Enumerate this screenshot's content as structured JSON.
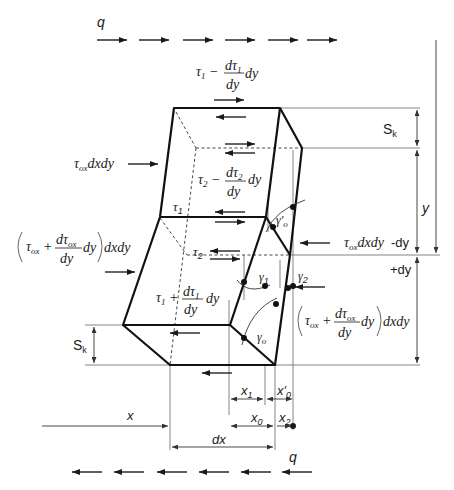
{
  "diagram": {
    "type": "shear-deformation-element",
    "labels": {
      "q_top": "q",
      "q_bottom": "q",
      "tau1_minus": {
        "base": "τ",
        "sub": "1",
        "op": "−",
        "num": "dτ",
        "num_sub": "1",
        "den": "dy",
        "tail": "dy"
      },
      "tau2_minus": {
        "base": "τ",
        "sub": "2",
        "op": "−",
        "num": "dτ",
        "num_sub": "2",
        "den": "dy",
        "tail": "dy"
      },
      "tau1_plus": {
        "base": "τ",
        "sub": "1",
        "op": "+",
        "num": "dτ",
        "num_sub": "1",
        "den": "dy",
        "tail": "dy"
      },
      "tau1": "τ1",
      "tau2": "τ2",
      "tau_ox_left": {
        "base": "τ",
        "sub": "ox",
        "tail": "dxdy"
      },
      "tau_ox_plus_left": {
        "base": "τ",
        "sub": "ox",
        "op": "+",
        "num": "dτ",
        "num_sub": "ox",
        "den": "dy",
        "tail": "dy",
        "after": "dxdy"
      },
      "tau_ox_right": {
        "base": "τ",
        "sub": "ox",
        "tail": "dxdy",
        "suffix": "-dy"
      },
      "tau_ox_plus_right": {
        "base": "τ",
        "sub": "ox",
        "op": "+",
        "num": "dτ",
        "num_sub": "ox",
        "den": "dy",
        "tail": "dy",
        "after": "dxdy"
      },
      "gamma0_prime": "γ'0",
      "gamma0": "γ0",
      "gamma1": "γ1",
      "gamma2": "γ2",
      "Sk_top": "Sk",
      "Sk_bottom": "Sk",
      "y": "y",
      "plus_dy": "+dy",
      "x": "x",
      "x0": "x0",
      "x1": "x1",
      "x2": "x2",
      "x0_prime": "x'0",
      "dx": "dx"
    },
    "colors": {
      "stroke": "#1a1a1a",
      "thin": "#555555",
      "background": "#ffffff"
    }
  }
}
